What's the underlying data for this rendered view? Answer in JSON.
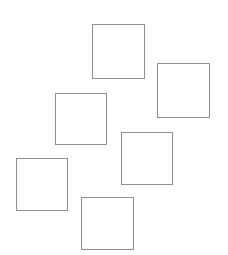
{
  "canvas": {
    "width": 228,
    "height": 255,
    "background_color": "#ffffff",
    "title": "Scattered Squares"
  },
  "shapes": [
    {
      "name": "square-1",
      "type": "square",
      "x": 92,
      "y": 24,
      "width": 53,
      "height": 55,
      "stroke_color": "#8f8f8f",
      "stroke_width": 1,
      "fill": "none",
      "label": ""
    },
    {
      "name": "square-2",
      "type": "square",
      "x": 157,
      "y": 63,
      "width": 53,
      "height": 55,
      "stroke_color": "#8f8f8f",
      "stroke_width": 1,
      "fill": "none",
      "label": ""
    },
    {
      "name": "square-3",
      "type": "square",
      "x": 55,
      "y": 93,
      "width": 52,
      "height": 52,
      "stroke_color": "#8f8f8f",
      "stroke_width": 1,
      "fill": "none",
      "label": ""
    },
    {
      "name": "square-4",
      "type": "square",
      "x": 121,
      "y": 132,
      "width": 52,
      "height": 53,
      "stroke_color": "#8f8f8f",
      "stroke_width": 1,
      "fill": "none",
      "label": ""
    },
    {
      "name": "square-5",
      "type": "square",
      "x": 16,
      "y": 158,
      "width": 52,
      "height": 53,
      "stroke_color": "#8f8f8f",
      "stroke_width": 1,
      "fill": "none",
      "label": ""
    },
    {
      "name": "square-6",
      "type": "square",
      "x": 81,
      "y": 197,
      "width": 53,
      "height": 53,
      "stroke_color": "#8f8f8f",
      "stroke_width": 1,
      "fill": "none",
      "label": ""
    }
  ]
}
